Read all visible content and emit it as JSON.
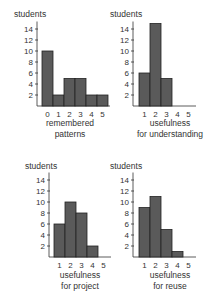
{
  "chart_data": [
    {
      "type": "bar",
      "title": "",
      "ylabel": "students",
      "xlabel": "remembered patterns",
      "xlabel_lines": [
        "remembered",
        "patterns"
      ],
      "categories": [
        "0",
        "1",
        "2",
        "3",
        "4",
        "5"
      ],
      "values": [
        10,
        2,
        5,
        5,
        2,
        2
      ],
      "ylim": [
        0,
        15
      ],
      "yticks": [
        2,
        4,
        6,
        8,
        10,
        12,
        14
      ],
      "grid": false
    },
    {
      "type": "bar",
      "title": "",
      "ylabel": "students",
      "xlabel": "usefulness for understanding",
      "xlabel_lines": [
        "usefulness",
        "for understanding"
      ],
      "categories": [
        "1",
        "2",
        "3",
        "4",
        "5"
      ],
      "values": [
        6,
        15,
        5,
        0,
        0
      ],
      "ylim": [
        0,
        15
      ],
      "yticks": [
        2,
        4,
        6,
        8,
        10,
        12,
        14
      ],
      "grid": false
    },
    {
      "type": "bar",
      "title": "",
      "ylabel": "students",
      "xlabel": "usefulness for project",
      "xlabel_lines": [
        "usefulness",
        "for project"
      ],
      "categories": [
        "1",
        "2",
        "3",
        "4",
        "5"
      ],
      "values": [
        6,
        10,
        8,
        2,
        0
      ],
      "ylim": [
        0,
        15
      ],
      "yticks": [
        2,
        4,
        6,
        8,
        10,
        12,
        14
      ],
      "grid": false
    },
    {
      "type": "bar",
      "title": "",
      "ylabel": "students",
      "xlabel": "usefulness for reuse",
      "xlabel_lines": [
        "usefulness",
        "for reuse"
      ],
      "categories": [
        "1",
        "2",
        "3",
        "4",
        "5"
      ],
      "values": [
        9,
        11,
        5,
        1,
        0
      ],
      "ylim": [
        0,
        15
      ],
      "yticks": [
        2,
        4,
        6,
        8,
        10,
        12,
        14
      ],
      "grid": false
    }
  ],
  "style": {
    "bar_fill": "#5a5a5a",
    "bar_stroke": "#222222",
    "axis_color": "#333333"
  }
}
